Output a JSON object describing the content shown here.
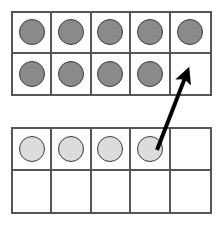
{
  "diagram": {
    "background_color": "#ffffff",
    "frame_border_color": "#555555",
    "counter_outline_color": "#3a3a3a",
    "dark_counter_color": "#8a8a8a",
    "light_counter_color": "#dcdcdc",
    "arrow_color": "#000000"
  },
  "frames": [
    {
      "name": "top-ten-frame",
      "label": "Top ten frame",
      "rows": 2,
      "columns": 5,
      "filled_count": 9,
      "cells": [
        {
          "index": 0,
          "row": 0,
          "column": 0,
          "counter": "dark"
        },
        {
          "index": 1,
          "row": 0,
          "column": 1,
          "counter": "dark"
        },
        {
          "index": 2,
          "row": 0,
          "column": 2,
          "counter": "dark"
        },
        {
          "index": 3,
          "row": 0,
          "column": 3,
          "counter": "dark"
        },
        {
          "index": 4,
          "row": 0,
          "column": 4,
          "counter": "dark"
        },
        {
          "index": 5,
          "row": 1,
          "column": 0,
          "counter": "dark"
        },
        {
          "index": 6,
          "row": 1,
          "column": 1,
          "counter": "dark"
        },
        {
          "index": 7,
          "row": 1,
          "column": 2,
          "counter": "dark"
        },
        {
          "index": 8,
          "row": 1,
          "column": 3,
          "counter": "dark"
        },
        {
          "index": 9,
          "row": 1,
          "column": 4,
          "counter": "empty"
        }
      ]
    },
    {
      "name": "bottom-ten-frame",
      "label": "Bottom ten frame",
      "rows": 2,
      "columns": 5,
      "filled_count": 4,
      "cells": [
        {
          "index": 0,
          "row": 0,
          "column": 0,
          "counter": "light"
        },
        {
          "index": 1,
          "row": 0,
          "column": 1,
          "counter": "light"
        },
        {
          "index": 2,
          "row": 0,
          "column": 2,
          "counter": "light"
        },
        {
          "index": 3,
          "row": 0,
          "column": 3,
          "counter": "light"
        },
        {
          "index": 4,
          "row": 0,
          "column": 4,
          "counter": "empty"
        },
        {
          "index": 5,
          "row": 1,
          "column": 0,
          "counter": "empty"
        },
        {
          "index": 6,
          "row": 1,
          "column": 1,
          "counter": "empty"
        },
        {
          "index": 7,
          "row": 1,
          "column": 2,
          "counter": "empty"
        },
        {
          "index": 8,
          "row": 1,
          "column": 3,
          "counter": "empty"
        },
        {
          "index": 9,
          "row": 1,
          "column": 4,
          "counter": "empty"
        }
      ]
    }
  ],
  "arrow": {
    "name": "move-counter-arrow",
    "label": "Arrow moving a counter from the bottom frame to the empty cell in the top frame",
    "from": {
      "x": 157,
      "y": 150
    },
    "to": {
      "x": 188,
      "y": 70
    },
    "color": "#000000"
  }
}
